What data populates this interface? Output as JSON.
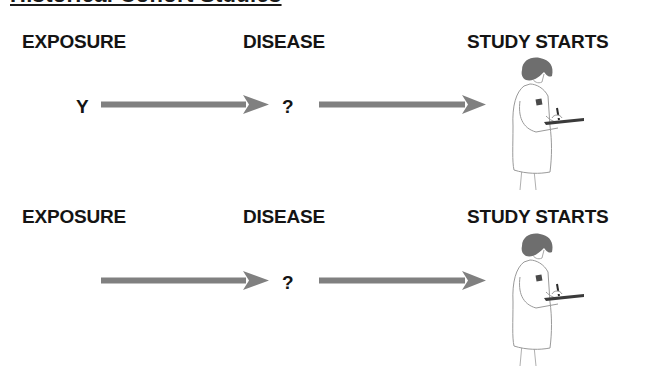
{
  "title": "Historical Cohort Studies",
  "colors": {
    "arrow": "#808080",
    "text": "#141414",
    "hair": "#6e6e6e",
    "coat_outline": "#9a9a9a"
  },
  "rows": [
    {
      "headings": {
        "exposure": "EXPOSURE",
        "disease": "DISEASE",
        "study": "STUDY STARTS"
      },
      "exposure_value": "Y",
      "disease_value": "?",
      "figure": "doctor-with-clipboard"
    },
    {
      "headings": {
        "exposure": "EXPOSURE",
        "disease": "DISEASE",
        "study": "STUDY STARTS"
      },
      "exposure_value": "",
      "disease_value": "?",
      "figure": "doctor-with-clipboard"
    }
  ]
}
